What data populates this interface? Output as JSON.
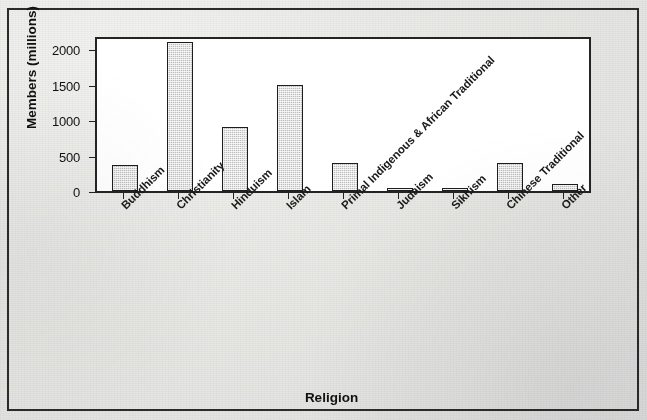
{
  "chart_data": {
    "type": "bar",
    "title": "",
    "xlabel": "Religion",
    "ylabel": "Members (millions)",
    "categories": [
      "Buddhism",
      "Christianity",
      "Hinduism",
      "Islam",
      "Primal Indigenous & African Traditional",
      "Judaism",
      "Sikhism",
      "Chinese Traditional",
      "Other"
    ],
    "values": [
      360,
      2100,
      900,
      1500,
      400,
      14,
      23,
      400,
      100
    ],
    "ylim": [
      0,
      2200
    ],
    "yticks": [
      0,
      500,
      1000,
      1500,
      2000
    ],
    "ytick_labels": [
      "0",
      "500",
      "1000",
      "1500",
      "2000"
    ],
    "grid": false,
    "legend": null,
    "bar_fill_color": "#bdbdbd",
    "bar_border_color": "#1d1d1d",
    "plot_background": "#ffffff",
    "page_background": "#e8e8e6",
    "axis_color": "#222222"
  },
  "frame": {
    "border_color": "#2b2b2b"
  }
}
